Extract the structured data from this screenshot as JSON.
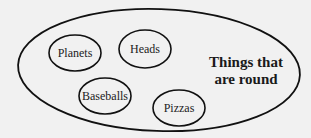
{
  "diagram": {
    "type": "set-membership",
    "background_color": "#f1f1f1",
    "stroke_color": "#111111",
    "outer_set": {
      "label_line1": "Things that",
      "label_line2": "are round",
      "cx": 159,
      "cy": 70,
      "rx": 141,
      "ry": 61
    },
    "members": [
      {
        "label": "Planets",
        "cx": 75,
        "cy": 53,
        "rx": 26,
        "ry": 18
      },
      {
        "label": "Heads",
        "cx": 145,
        "cy": 49,
        "rx": 26,
        "ry": 19
      },
      {
        "label": "Baseballs",
        "cx": 105,
        "cy": 96,
        "rx": 26,
        "ry": 18
      },
      {
        "label": "Pizzas",
        "cx": 179,
        "cy": 108,
        "rx": 26,
        "ry": 18
      }
    ]
  }
}
